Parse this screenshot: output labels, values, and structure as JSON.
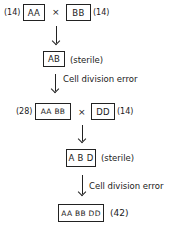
{
  "diagram": {
    "row1": {
      "left_count": "(14)",
      "left_box": "AA",
      "cross": "×",
      "right_box": "BB",
      "right_count": "(14)"
    },
    "row2": {
      "box": "AB",
      "note": "(sterile)"
    },
    "arrow2_label": "Cell division error",
    "row3": {
      "left_count": "(28)",
      "left_box": "AA BB",
      "cross": "×",
      "right_box": "DD",
      "right_count": "(14)"
    },
    "row4": {
      "box": "A B D",
      "note": "(sterile)"
    },
    "arrow4_label": "Cell division error",
    "row5": {
      "box": "AA BB DD",
      "count": "(42)"
    }
  }
}
